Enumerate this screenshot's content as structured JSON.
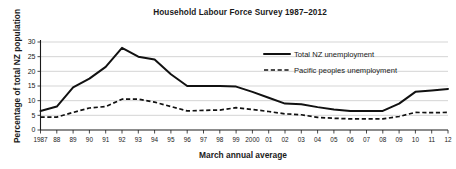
{
  "chart_data": {
    "type": "line",
    "title": "Household Labour Force Survey 1987–2012",
    "xlabel": "March annual average",
    "ylabel": "Percentage of total NZ population",
    "ylim": [
      0,
      30
    ],
    "yticks": [
      0,
      5,
      10,
      15,
      20,
      25,
      30
    ],
    "grid": true,
    "legend_position": "top-right",
    "categories": [
      "1987",
      "88",
      "89",
      "90",
      "91",
      "92",
      "93",
      "94",
      "95",
      "96",
      "97",
      "98",
      "99",
      "2000",
      "01",
      "02",
      "03",
      "04",
      "05",
      "06",
      "07",
      "08",
      "09",
      "10",
      "11",
      "12"
    ],
    "series": [
      {
        "name": "Total NZ unemployment",
        "style": "solid",
        "values": [
          6.5,
          8.0,
          14.5,
          17.5,
          21.5,
          28.0,
          25.0,
          24.0,
          19.0,
          15.0,
          15.0,
          15.0,
          14.8,
          13.0,
          11.0,
          9.0,
          8.8,
          7.8,
          7.0,
          6.5,
          6.5,
          6.5,
          9.0,
          13.0,
          13.5,
          14.0
        ]
      },
      {
        "name": "Pacific peoples unemployment",
        "style": "dashed",
        "values": [
          4.4,
          4.4,
          6.0,
          7.5,
          8.0,
          10.5,
          10.5,
          9.5,
          8.0,
          6.5,
          6.7,
          6.8,
          7.6,
          7.0,
          6.3,
          5.5,
          5.2,
          4.3,
          4.0,
          3.8,
          3.8,
          3.8,
          4.6,
          6.0,
          5.9,
          6.0
        ]
      }
    ]
  },
  "legend": {
    "items": [
      {
        "label": "Total NZ unemployment",
        "style": "solid"
      },
      {
        "label": "Pacific peoples unemployment",
        "style": "dashed"
      }
    ]
  }
}
